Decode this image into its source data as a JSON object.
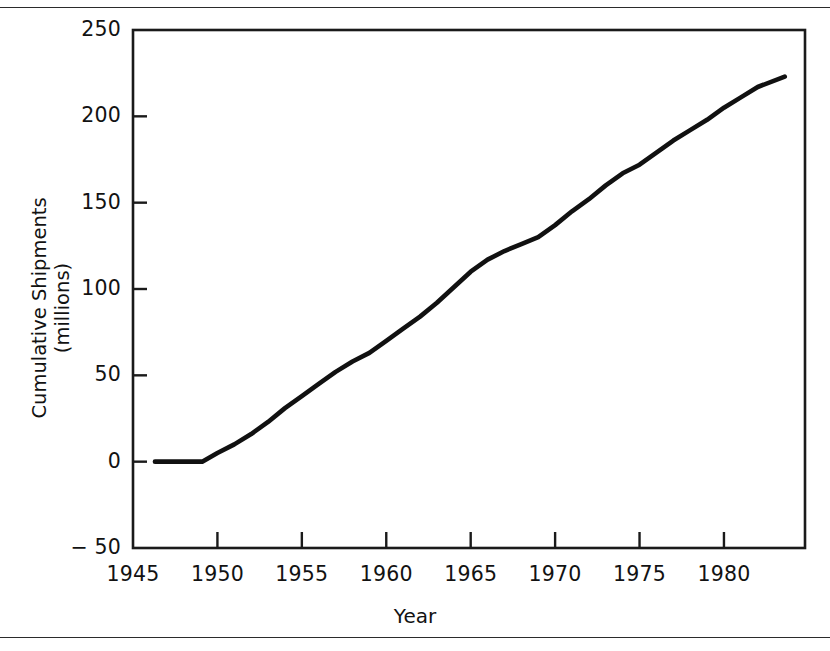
{
  "figure": {
    "has_top_rule": true,
    "has_bottom_rule": true,
    "line_color": "#111111",
    "axis_color": "#1a1a1a",
    "background": "#ffffff"
  },
  "axes": {
    "y_title_line1": "Cumulative Shipments",
    "y_title_line2": "(millions)",
    "x_title": "Year",
    "y_ticks": [
      "250",
      "200",
      "150",
      "100",
      "50",
      "0",
      "− 50"
    ],
    "x_ticks": [
      "1945",
      "1950",
      "1955",
      "1960",
      "1965",
      "1970",
      "1975",
      "1980"
    ]
  },
  "chart_data": {
    "type": "line",
    "title": "",
    "subtitle": "",
    "xlabel": "Year",
    "ylabel": "Cumulative Shipments (millions)",
    "xlim": [
      1945,
      1984.8
    ],
    "ylim": [
      -50,
      250
    ],
    "xticks": [
      1945,
      1950,
      1955,
      1960,
      1965,
      1970,
      1975,
      1980
    ],
    "yticks": [
      -50,
      0,
      50,
      100,
      150,
      200,
      250
    ],
    "grid": false,
    "legend": null,
    "series": [
      {
        "name": "Cumulative Shipments",
        "x": [
          1946.3,
          1947,
          1948,
          1949.1,
          1950,
          1951,
          1952,
          1953,
          1954,
          1955,
          1956,
          1957,
          1958,
          1959,
          1960,
          1961,
          1962,
          1963,
          1964,
          1965,
          1966,
          1967,
          1968,
          1969,
          1970,
          1971,
          1972,
          1973,
          1974,
          1975,
          1976,
          1977,
          1978,
          1979,
          1980,
          1981,
          1982,
          1983.6
        ],
        "y": [
          0,
          0,
          0,
          0,
          5,
          10,
          16,
          23,
          31,
          38,
          45,
          52,
          58,
          63,
          70,
          77,
          84,
          92,
          101,
          110,
          117,
          122,
          126,
          130,
          137,
          145,
          152,
          160,
          167,
          172,
          179,
          186,
          192,
          198,
          205,
          211,
          217,
          223
        ]
      }
    ]
  }
}
